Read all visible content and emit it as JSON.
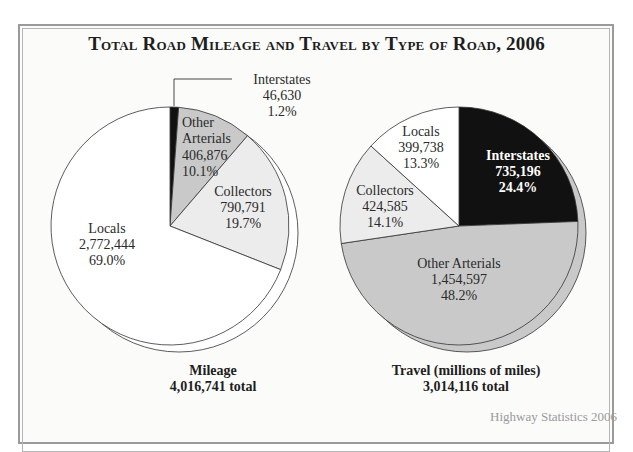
{
  "chart_data": [
    {
      "type": "pie",
      "title": "Total Road Mileage and Travel by Type of Road, 2006",
      "subtitle": "Mileage",
      "total_label": "4,016,741 total",
      "total": 4016741,
      "categories": [
        "Interstates",
        "Other Arterials",
        "Collectors",
        "Locals"
      ],
      "values": [
        46630,
        406876,
        790791,
        2772444
      ],
      "value_labels": [
        "46,630",
        "406,876",
        "790,791",
        "2,772,444"
      ],
      "percents": [
        1.2,
        10.1,
        19.7,
        69.0
      ],
      "percent_labels": [
        "1.2%",
        "10.1%",
        "19.7%",
        "69.0%"
      ],
      "colors": [
        "#111111",
        "#c9c9c9",
        "#ececec",
        "#ffffff"
      ],
      "shadow_fill": "#ffffff",
      "start_angle_deg": 0,
      "direction": "clockwise"
    },
    {
      "type": "pie",
      "title": "Total Road Mileage and Travel by Type of Road, 2006",
      "subtitle": "Travel (millions of miles)",
      "total_label": "3,014,116 total",
      "total": 3014116,
      "categories": [
        "Interstates",
        "Other Arterials",
        "Collectors",
        "Locals"
      ],
      "values": [
        735196,
        1454597,
        424585,
        399738
      ],
      "value_labels": [
        "735,196",
        "1,454,597",
        "424,585",
        "399,738"
      ],
      "percents": [
        24.4,
        48.2,
        14.1,
        13.3
      ],
      "percent_labels": [
        "24.4%",
        "48.2%",
        "14.1%",
        "13.3%"
      ],
      "colors": [
        "#111111",
        "#c9c9c9",
        "#ececec",
        "#ffffff"
      ],
      "shadow_fill": "#c9c9c9",
      "start_angle_deg": 0,
      "direction": "clockwise"
    }
  ],
  "page": {
    "title": "Total Road Mileage and Travel by Type of Road, 2006",
    "left_caption": {
      "line1": "Mileage",
      "line2": "4,016,741 total"
    },
    "right_caption": {
      "line1": "Travel (millions of miles)",
      "line2": "3,014,116 total"
    },
    "source_partial": "Highway Statistics 2006"
  }
}
